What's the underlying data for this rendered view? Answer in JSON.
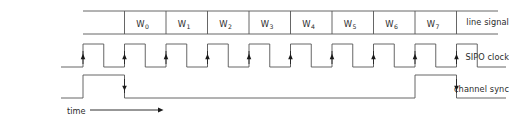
{
  "figure": {
    "type": "timing-diagram",
    "title": "",
    "background_color": "#ffffff",
    "line_color": "#555555",
    "text_color": "#2b2b2b",
    "marker_color": "#1a1a1a"
  },
  "rows": [
    {
      "id": "line-signal",
      "label": "line signal"
    },
    {
      "id": "sipo-clock",
      "label": "SIPO clock"
    },
    {
      "id": "channel-sync",
      "label": "channel sync"
    }
  ],
  "axis": {
    "label": "time",
    "direction": "right",
    "arrow": "→"
  },
  "line_signal": {
    "cells": [
      {
        "index": 0,
        "base": "",
        "sub": "",
        "empty": true
      },
      {
        "index": 1,
        "base": "W",
        "sub": "0",
        "empty": false
      },
      {
        "index": 2,
        "base": "W",
        "sub": "1",
        "empty": false
      },
      {
        "index": 3,
        "base": "W",
        "sub": "2",
        "empty": false
      },
      {
        "index": 4,
        "base": "W",
        "sub": "3",
        "empty": false
      },
      {
        "index": 5,
        "base": "W",
        "sub": "4",
        "empty": false
      },
      {
        "index": 6,
        "base": "W",
        "sub": "5",
        "empty": false
      },
      {
        "index": 7,
        "base": "W",
        "sub": "6",
        "empty": false
      },
      {
        "index": 8,
        "base": "W",
        "sub": "7",
        "empty": false
      },
      {
        "index": 9,
        "base": "",
        "sub": "",
        "empty": true
      }
    ]
  },
  "chart_data": {
    "type": "line",
    "title": "",
    "xlabel": "time",
    "ylabel": "",
    "grid": false,
    "legend": "none",
    "time_axis": {
      "x_start_px": 83,
      "x_end_px": 498,
      "cycles": 10,
      "cycle_width_px": 41.5
    },
    "series": [
      {
        "name": "line signal",
        "kind": "framed-word-cells",
        "cells": [
          "",
          "W0",
          "W1",
          "W2",
          "W3",
          "W4",
          "W5",
          "W6",
          "W7",
          ""
        ],
        "cell_count": 10
      },
      {
        "name": "SIPO clock",
        "kind": "square-wave",
        "cycles": 10,
        "duty_cycle": 0.5,
        "edge_markers": "rising",
        "marker_count": 10,
        "values": [
          0,
          1,
          0,
          1,
          0,
          1,
          0,
          1,
          0,
          1,
          0,
          1,
          0,
          1,
          0,
          1,
          0,
          1,
          0,
          1
        ]
      },
      {
        "name": "channel sync",
        "kind": "pulse",
        "pulses": [
          {
            "rise_cycle": 0,
            "fall_cycle": 1,
            "marker": "falling"
          },
          {
            "rise_cycle": 8,
            "fall_cycle": 9,
            "marker": "falling"
          }
        ],
        "idle_level": 0
      }
    ]
  }
}
